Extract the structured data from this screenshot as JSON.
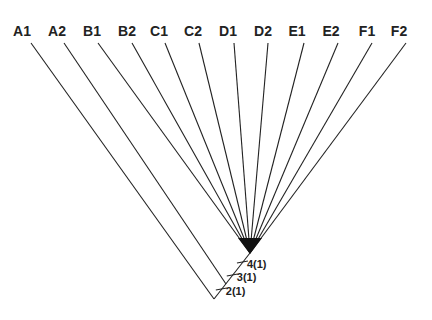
{
  "diagram": {
    "type": "cladogram",
    "taxa": [
      "A1",
      "A2",
      "B1",
      "B2",
      "C1",
      "C2",
      "D1",
      "D2",
      "E1",
      "E2",
      "F1",
      "F2"
    ],
    "node_labels": [
      "4(1)",
      "3(1)",
      "2(1)"
    ]
  }
}
